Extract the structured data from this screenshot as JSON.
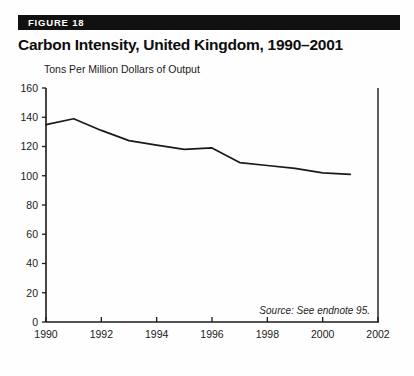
{
  "figure": {
    "banner_label": "FIGURE 18",
    "title": "Carbon Intensity, United Kingdom, 1990–2001",
    "source_note": "Source: See endnote 95.",
    "banner_color": "#111111",
    "banner_text_color": "#ffffff",
    "line_color": "#1a1a1a",
    "axis_color": "#1a1a1a"
  },
  "chart_data": {
    "type": "line",
    "title": "Carbon Intensity, United Kingdom, 1990–2001",
    "subtitle": "",
    "xlabel": "",
    "ylabel": "Tons Per Million Dollars of Output",
    "x": [
      1990,
      1991,
      1992,
      1993,
      1994,
      1995,
      1996,
      1997,
      1998,
      1999,
      2000,
      2001
    ],
    "values": [
      135,
      139,
      131,
      124,
      121,
      118,
      119,
      109,
      107,
      105,
      102,
      101
    ],
    "series": [
      {
        "name": "Carbon Intensity",
        "values": [
          135,
          139,
          131,
          124,
          121,
          118,
          119,
          109,
          107,
          105,
          102,
          101
        ]
      }
    ],
    "xlim": [
      1990,
      2002
    ],
    "ylim": [
      0,
      160
    ],
    "ytick_values": [
      0,
      20,
      40,
      60,
      80,
      100,
      120,
      140,
      160
    ],
    "ytick_labels": [
      "0",
      "20",
      "40",
      "60",
      "80",
      "100",
      "120",
      "140",
      "160"
    ],
    "xtick_values": [
      1990,
      1992,
      1994,
      1996,
      1998,
      2000,
      2002
    ],
    "xtick_labels": [
      "1990",
      "1992",
      "1994",
      "1996",
      "1998",
      "2000",
      "2002"
    ],
    "grid": false,
    "legend": false,
    "legend_position": "none",
    "annotations": [
      "Source: See endnote 95."
    ]
  }
}
